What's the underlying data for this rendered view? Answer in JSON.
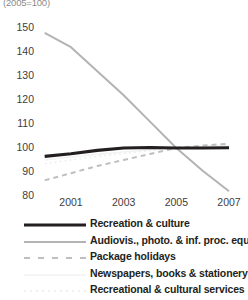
{
  "chart_data": {
    "type": "line",
    "title": "(2005=100)",
    "xlabel": "",
    "ylabel": "",
    "ylim": [
      80,
      150
    ],
    "yticks": [
      150,
      140,
      130,
      120,
      110,
      100,
      90,
      80
    ],
    "xticks": [
      "2001",
      "2003",
      "2005",
      "2007"
    ],
    "x": [
      2000,
      2001,
      2002,
      2003,
      2004,
      2005,
      2006,
      2007
    ],
    "grid": false,
    "legend_position": "bottom",
    "series": [
      {
        "name": "Recreation & culture",
        "style": "solid",
        "color": "#231f20",
        "width": 3.2,
        "values": [
          96.5,
          97.6,
          99.0,
          100.0,
          100.2,
          100.0,
          100.0,
          100.1
        ]
      },
      {
        "name": "Audiovis., photo. & inf. proc. equip.",
        "style": "solid",
        "color": "#b3b3b3",
        "width": 2.0,
        "values": [
          148.0,
          142.0,
          132.0,
          122.0,
          111.0,
          100.0,
          90.5,
          82.0
        ]
      },
      {
        "name": "Package holidays",
        "style": "dashed",
        "color": "#bfbfbf",
        "width": 2.0,
        "values": [
          86.5,
          89.5,
          92.5,
          95.0,
          97.5,
          100.0,
          101.0,
          101.8
        ]
      },
      {
        "name": "Newspapers, books & stationery",
        "style": "solid",
        "color": "#f2f2f2",
        "width": 1.4,
        "values": [
          95.0,
          96.2,
          97.4,
          98.4,
          99.2,
          100.0,
          100.6,
          101.0
        ]
      },
      {
        "name": "Recreational & cultural services",
        "style": "dotted",
        "color": "#ededed",
        "width": 1.4,
        "values": [
          93.5,
          95.0,
          96.5,
          97.8,
          98.9,
          100.0,
          100.8,
          101.4
        ]
      }
    ]
  },
  "legend": {
    "items": [
      {
        "label": "Recreation & culture"
      },
      {
        "label": "Audiovis., photo. & inf. proc. equip."
      },
      {
        "label": "Package holidays"
      },
      {
        "label": "Newspapers, books & stationery"
      },
      {
        "label": "Recreational & cultural services"
      }
    ]
  }
}
